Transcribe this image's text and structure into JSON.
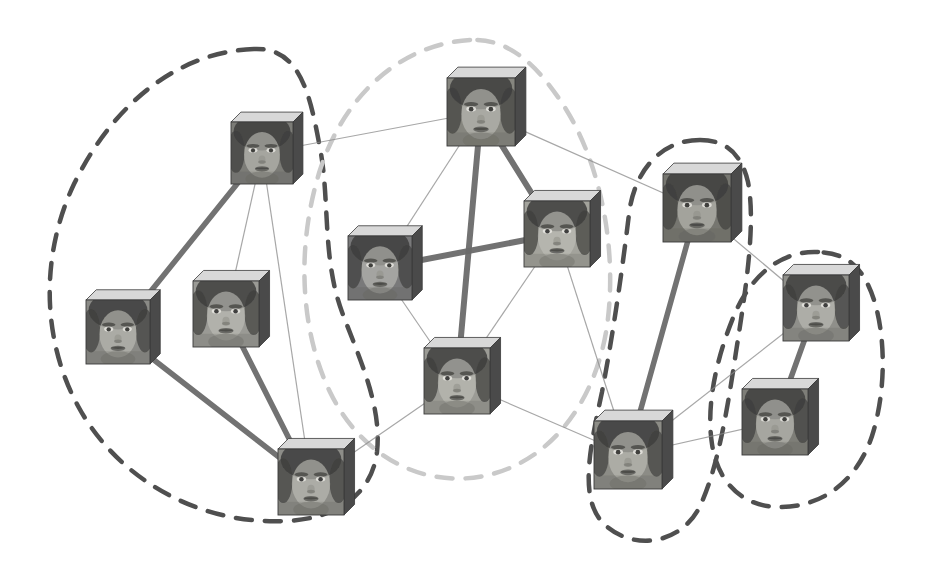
{
  "figure": {
    "width": 926,
    "height": 572,
    "background_color": "#ffffff"
  },
  "style": {
    "strong_edge_color": "#6b6b6b",
    "weak_edge_color": "#8a8a8a",
    "cube_top_color": "#d8d8d8",
    "cube_side_color": "#4a4a4a",
    "cube_outline_color": "#3a3a3a",
    "cluster_dark_color": "#4f4f4f",
    "cluster_light_color": "#c9c9c9"
  },
  "graph_data": {
    "type": "graph",
    "node_count": 12,
    "edge_count": 21,
    "cluster_count": 4,
    "nodes": [
      {
        "id": "n1",
        "label": "face-1",
        "cluster": "cluster-a",
        "x": 262,
        "y": 153,
        "size": 62,
        "subject": "man-frontal-dark-hair",
        "tone": "#7b7b77"
      },
      {
        "id": "n2",
        "label": "face-2",
        "cluster": "cluster-a",
        "x": 118,
        "y": 332,
        "size": 64,
        "subject": "man-frontal-short-hair",
        "tone": "#8a8a86"
      },
      {
        "id": "n3",
        "label": "face-3",
        "cluster": "cluster-a",
        "x": 226,
        "y": 314,
        "size": 66,
        "subject": "man-young-light-hair",
        "tone": "#9a9a95"
      },
      {
        "id": "n4",
        "label": "face-4",
        "cluster": "cluster-a",
        "x": 311,
        "y": 482,
        "size": 66,
        "subject": "man-older-balding",
        "tone": "#8d8d88"
      },
      {
        "id": "n5",
        "label": "face-5",
        "cluster": "cluster-b",
        "x": 481,
        "y": 112,
        "size": 68,
        "subject": "woman-smiling-dark-hair",
        "tone": "#86867f"
      },
      {
        "id": "n6",
        "label": "face-6",
        "cluster": "cluster-b",
        "x": 380,
        "y": 268,
        "size": 64,
        "subject": "woman-dark-brows",
        "tone": "#79797a"
      },
      {
        "id": "n7",
        "label": "face-7",
        "cluster": "cluster-b",
        "x": 557,
        "y": 234,
        "size": 66,
        "subject": "woman-smiling-bright",
        "tone": "#a3a39c"
      },
      {
        "id": "n8",
        "label": "face-8",
        "cluster": "cluster-b",
        "x": 457,
        "y": 381,
        "size": 66,
        "subject": "woman-eyes-closed",
        "tone": "#9b9b95"
      },
      {
        "id": "n9",
        "label": "face-9",
        "cluster": "cluster-c",
        "x": 697,
        "y": 208,
        "size": 68,
        "subject": "woman-long-dark-hair",
        "tone": "#76766f"
      },
      {
        "id": "n10",
        "label": "face-10",
        "cluster": "cluster-c",
        "x": 628,
        "y": 455,
        "size": 68,
        "subject": "woman-neutral-frontal",
        "tone": "#8c8c86"
      },
      {
        "id": "n11",
        "label": "face-11",
        "cluster": "cluster-d",
        "x": 816,
        "y": 308,
        "size": 66,
        "subject": "woman-bob-haircut",
        "tone": "#8f8f8a"
      },
      {
        "id": "n12",
        "label": "face-12",
        "cluster": "cluster-d",
        "x": 775,
        "y": 422,
        "size": 66,
        "subject": "woman-bangs-dark-hair",
        "tone": "#7e7e78"
      }
    ],
    "edges": [
      {
        "source": "n1",
        "target": "n2",
        "weight": "strong",
        "width": 5.5
      },
      {
        "source": "n1",
        "target": "n4",
        "weight": "weak",
        "width": 1.2
      },
      {
        "source": "n1",
        "target": "n3",
        "weight": "weak",
        "width": 1.2
      },
      {
        "source": "n1",
        "target": "n5",
        "weight": "weak",
        "width": 1.2
      },
      {
        "source": "n2",
        "target": "n4",
        "weight": "strong",
        "width": 5.5
      },
      {
        "source": "n3",
        "target": "n4",
        "weight": "strong",
        "width": 5.5
      },
      {
        "source": "n4",
        "target": "n8",
        "weight": "weak",
        "width": 1.2
      },
      {
        "source": "n5",
        "target": "n7",
        "weight": "strong",
        "width": 6.0
      },
      {
        "source": "n5",
        "target": "n8",
        "weight": "strong",
        "width": 6.0
      },
      {
        "source": "n5",
        "target": "n6",
        "weight": "weak",
        "width": 1.2
      },
      {
        "source": "n5",
        "target": "n9",
        "weight": "weak",
        "width": 1.2
      },
      {
        "source": "n6",
        "target": "n7",
        "weight": "strong",
        "width": 6.0
      },
      {
        "source": "n6",
        "target": "n8",
        "weight": "weak",
        "width": 1.2
      },
      {
        "source": "n7",
        "target": "n8",
        "weight": "weak",
        "width": 1.2
      },
      {
        "source": "n7",
        "target": "n10",
        "weight": "weak",
        "width": 1.2
      },
      {
        "source": "n8",
        "target": "n10",
        "weight": "weak",
        "width": 1.2
      },
      {
        "source": "n9",
        "target": "n10",
        "weight": "strong",
        "width": 5.5
      },
      {
        "source": "n9",
        "target": "n11",
        "weight": "weak",
        "width": 1.2
      },
      {
        "source": "n10",
        "target": "n11",
        "weight": "weak",
        "width": 1.2
      },
      {
        "source": "n10",
        "target": "n12",
        "weight": "weak",
        "width": 1.2
      },
      {
        "source": "n11",
        "target": "n12",
        "weight": "strong",
        "width": 5.5
      }
    ],
    "clusters": [
      {
        "id": "cluster-a",
        "label": "cluster-left",
        "members": [
          "n1",
          "n2",
          "n3",
          "n4"
        ],
        "outline_style": "dashed",
        "outline_color": "#4f4f4f",
        "outline_width": 4.5,
        "dash_pattern": "16 13",
        "path": "M 254 49 C 176 52 112 106 74 184 C 40 256 42 340 78 406 C 118 480 200 525 285 521 C 340 519 372 492 377 452 C 382 406 360 360 342 312 C 322 258 330 200 320 148 C 310 94 300 47 254 49 Z"
      },
      {
        "id": "cluster-b",
        "label": "cluster-center",
        "members": [
          "n5",
          "n6",
          "n7",
          "n8"
        ],
        "outline_style": "dashed",
        "outline_color": "#c9c9c9",
        "outline_width": 4.5,
        "dash_pattern": "16 13",
        "path": "M 470 40 C 400 44 344 96 320 170 C 296 246 300 330 330 392 C 362 458 424 488 484 476 C 552 462 596 400 607 326 C 618 248 600 158 560 100 C 533 60 505 38 470 40 Z"
      },
      {
        "id": "cluster-c",
        "label": "cluster-right-upper",
        "members": [
          "n9",
          "n10"
        ],
        "outline_style": "dashed",
        "outline_color": "#4f4f4f",
        "outline_width": 4.5,
        "dash_pattern": "16 13",
        "path": "M 700 140 C 660 140 634 172 629 214 C 622 272 613 334 602 392 C 590 448 578 500 605 525 C 635 552 681 543 699 508 C 717 472 727 412 736 352 C 746 288 756 224 748 182 C 741 152 724 140 700 140 Z"
      },
      {
        "id": "cluster-d",
        "label": "cluster-right-lower",
        "members": [
          "n11",
          "n12"
        ],
        "outline_style": "dashed",
        "outline_color": "#4f4f4f",
        "outline_width": 4.5,
        "dash_pattern": "16 13",
        "path": "M 818 252 C 778 250 748 280 733 318 C 716 360 706 406 712 444 C 718 484 744 508 782 507 C 826 506 858 478 872 436 C 886 392 886 338 874 300 C 863 266 846 253 818 252 Z"
      }
    ]
  }
}
